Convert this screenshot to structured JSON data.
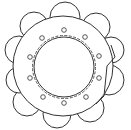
{
  "diagram": {
    "title": "",
    "stroke_color": "#333333",
    "background": "#ffffff",
    "outer_ring": {
      "cx": 63,
      "cy": 66,
      "r": 50
    },
    "inner_circle": {
      "cx": 64,
      "cy": 67,
      "r": 30
    },
    "inner_dashed_ring": {
      "cx": 64,
      "cy": 67,
      "r": 31.5
    },
    "lobes": [
      {
        "name": "top",
        "cx": 65,
        "cy": 17,
        "r": 15
      },
      {
        "name": "top-right",
        "cx": 96,
        "cy": 27,
        "r": 14
      },
      {
        "name": "right-upper",
        "cx": 111,
        "cy": 50,
        "r": 13
      },
      {
        "name": "right-lower",
        "cx": 109,
        "cy": 80,
        "r": 15
      },
      {
        "name": "bottom-right",
        "cx": 90,
        "cy": 108,
        "r": 14
      },
      {
        "name": "bottom",
        "cx": 57,
        "cy": 114,
        "r": 14
      },
      {
        "name": "bottom-left",
        "cx": 27,
        "cy": 102,
        "r": 14
      },
      {
        "name": "left-lower",
        "cx": 19,
        "cy": 80,
        "r": 13
      },
      {
        "name": "left-upper",
        "cx": 19,
        "cy": 50,
        "r": 14
      },
      {
        "name": "top-left",
        "cx": 34,
        "cy": 26,
        "r": 14
      }
    ],
    "holes": [
      {
        "cx": 64,
        "cy": 30,
        "r": 2.3
      },
      {
        "cx": 85,
        "cy": 37,
        "r": 2.3
      },
      {
        "cx": 99,
        "cy": 56,
        "r": 2.3
      },
      {
        "cx": 99,
        "cy": 78,
        "r": 2.3
      },
      {
        "cx": 86,
        "cy": 97,
        "r": 2.3
      },
      {
        "cx": 64,
        "cy": 103,
        "r": 2.3
      },
      {
        "cx": 43,
        "cy": 97,
        "r": 2.3
      },
      {
        "cx": 30,
        "cy": 78,
        "r": 2.3
      },
      {
        "cx": 30,
        "cy": 57,
        "r": 2.3
      },
      {
        "cx": 42,
        "cy": 38,
        "r": 2.3
      }
    ],
    "notch_path": "M 111 45 L 115 57 L 107 66 L 104 96 L 96 104"
  }
}
